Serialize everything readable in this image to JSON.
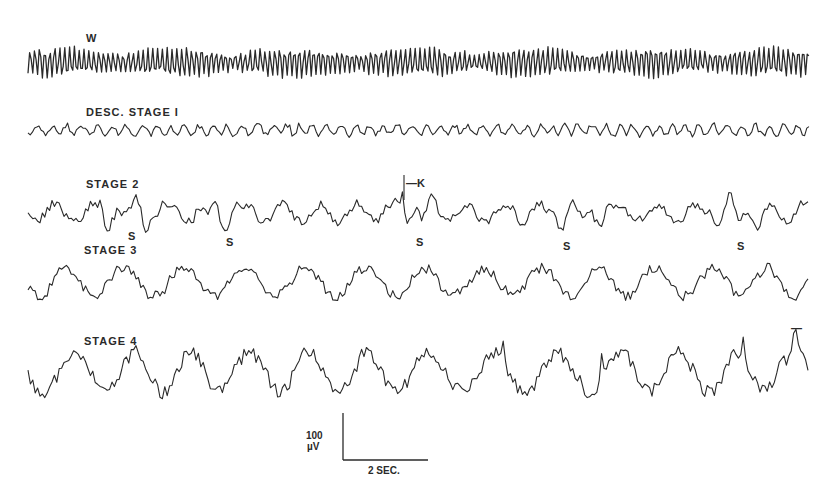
{
  "figure": {
    "ink_color": "#2a2a2a",
    "background": "#ffffff"
  },
  "traces": [
    {
      "id": "w",
      "label": "W",
      "label_x": 86,
      "label_y": 32,
      "baseline_y": 62,
      "amplitude": 15,
      "frequency": 1.05,
      "x_start": 28,
      "x_end": 810,
      "style": "alpha",
      "seed": 11
    },
    {
      "id": "stage1",
      "label": "DESC. STAGE I",
      "label_x": 86,
      "label_y": 106,
      "baseline_y": 130,
      "amplitude": 5,
      "frequency": 0.55,
      "x_start": 28,
      "x_end": 810,
      "style": "low",
      "seed": 23
    },
    {
      "id": "stage2",
      "label": "STAGE 2",
      "label_x": 86,
      "label_y": 178,
      "baseline_y": 213,
      "amplitude": 10,
      "frequency": 0.5,
      "x_start": 28,
      "x_end": 810,
      "style": "spindle",
      "seed": 37
    },
    {
      "id": "stage3",
      "label": "STAGE 3",
      "label_x": 84,
      "label_y": 244,
      "baseline_y": 282,
      "amplitude": 14,
      "frequency": 0.35,
      "x_start": 28,
      "x_end": 810,
      "style": "slow",
      "seed": 41
    },
    {
      "id": "stage4",
      "label": "STAGE 4",
      "label_x": 84,
      "label_y": 335,
      "baseline_y": 372,
      "amplitude": 20,
      "frequency": 0.28,
      "x_start": 28,
      "x_end": 810,
      "style": "delta",
      "seed": 53
    }
  ],
  "annotations": {
    "spindle_marks": [
      {
        "text": "S",
        "x": 128,
        "y": 230
      },
      {
        "text": "S",
        "x": 226,
        "y": 236
      },
      {
        "text": "S",
        "x": 416,
        "y": 236
      },
      {
        "text": "S",
        "x": 563,
        "y": 240
      },
      {
        "text": "S",
        "x": 737,
        "y": 240
      }
    ],
    "k_complex": {
      "text": "—K",
      "x": 406,
      "y": 177,
      "spike_x": 402
    },
    "stage4_tick": {
      "text": "—",
      "x": 791,
      "y": 322
    }
  },
  "scale_bar": {
    "voltage_label_value": "100",
    "voltage_label_unit": "µV",
    "time_label": "2 SEC.",
    "vertical": {
      "x": 343,
      "y_top": 413,
      "y_bottom": 460
    },
    "horizontal": {
      "x_start": 343,
      "x_end": 428,
      "y": 460
    },
    "voltage_label_x": 306,
    "voltage_label_y": 430,
    "time_label_x": 368,
    "time_label_y": 465
  },
  "spindles": {
    "stage2_regions": [
      [
        100,
        150
      ],
      [
        205,
        240
      ],
      [
        395,
        440
      ],
      [
        545,
        605
      ],
      [
        705,
        765
      ]
    ]
  }
}
